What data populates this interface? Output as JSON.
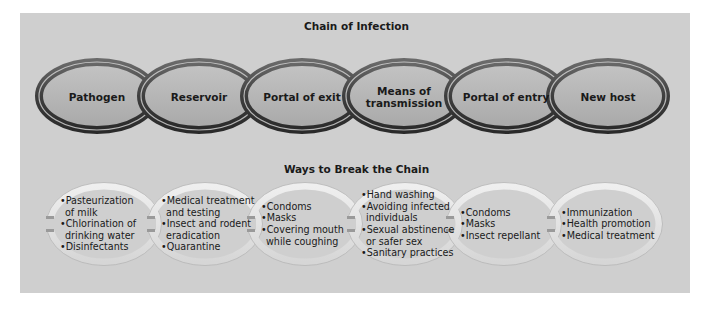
{
  "diagram": {
    "chain_title": "Chain of Infection",
    "break_title": "Ways to Break the Chain",
    "chain_links": [
      {
        "label_lines": [
          "Pathogen"
        ]
      },
      {
        "label_lines": [
          "Reservoir"
        ]
      },
      {
        "label_lines": [
          "Portal of exit"
        ]
      },
      {
        "label_lines": [
          "Means of",
          "transmission"
        ]
      },
      {
        "label_lines": [
          "Portal of entry"
        ]
      },
      {
        "label_lines": [
          "New host"
        ]
      }
    ],
    "break_links": [
      {
        "items": [
          [
            "Pasteurization",
            "of milk"
          ],
          [
            "Chlorination of",
            "drinking water"
          ],
          [
            "Disinfectants"
          ]
        ]
      },
      {
        "items": [
          [
            "Medical treatment",
            "and testing"
          ],
          [
            "Insect and rodent",
            "eradication"
          ],
          [
            "Quarantine"
          ]
        ]
      },
      {
        "items": [
          [
            "Condoms"
          ],
          [
            "Masks"
          ],
          [
            "Covering mouth",
            "while coughing"
          ]
        ]
      },
      {
        "items": [
          [
            "Hand washing"
          ],
          [
            "Avoiding infected",
            "individuals"
          ],
          [
            "Sexual abstinence",
            "or safer sex"
          ],
          [
            "Sanitary practices"
          ]
        ]
      },
      {
        "items": [
          [
            "Condoms"
          ],
          [
            "Masks"
          ],
          [
            "Insect repellant"
          ]
        ]
      },
      {
        "items": [
          [
            "Immunization"
          ],
          [
            "Health promotion"
          ],
          [
            "Medical treatment"
          ]
        ]
      }
    ],
    "colors": {
      "panel_bg": "#cfcfcf",
      "chain_ring": "#4a4a4a",
      "chain_fill": "#b9b9b9",
      "break_ring": "#e4e4e4",
      "text": "#1a1a1a"
    }
  }
}
